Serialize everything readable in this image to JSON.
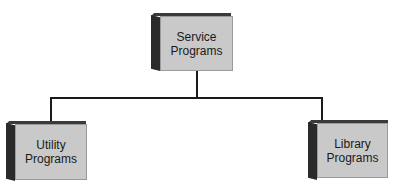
{
  "diagram": {
    "type": "hierarchy",
    "nodes": [
      {
        "id": "service",
        "line1": "Service",
        "line2": "Programs",
        "role": "parent"
      },
      {
        "id": "utility",
        "line1": "Utility",
        "line2": "Programs",
        "role": "child"
      },
      {
        "id": "library",
        "line1": "Library",
        "line2": "Programs",
        "role": "child"
      }
    ],
    "edges": [
      {
        "from": "service",
        "to": "utility"
      },
      {
        "from": "service",
        "to": "library"
      }
    ],
    "colors": {
      "face": "#c9c9c9",
      "side": "#2a2a2a",
      "line": "#1a1a1a",
      "background": "#ffffff"
    }
  }
}
